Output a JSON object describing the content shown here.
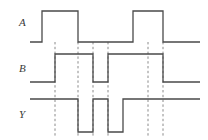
{
  "figure": {
    "type": "digital-timing-diagram",
    "width": 208,
    "height": 140,
    "background_color": "#ffffff",
    "waveform_color": "#4a4a4a",
    "marker_color": "#8a8a8a",
    "label_color": "#3a3a3a"
  },
  "labels": {
    "a": "A",
    "b": "B",
    "y": "Y"
  },
  "chart_data": {
    "type": "line",
    "title": "",
    "xlabel": "",
    "ylabel": "",
    "xlim": [
      30,
      200
    ],
    "grid": false,
    "legend": "none",
    "annotations": [],
    "marker_lines_x": [
      55,
      78,
      93,
      108,
      148,
      163
    ],
    "series": [
      {
        "name": "A",
        "label": "A",
        "low_y": 42,
        "high_y": 11,
        "start_x": 30,
        "end_x": 200,
        "initial_level": 0,
        "transitions": [
          {
            "x": 42,
            "level": 1
          },
          {
            "x": 78,
            "level": 0
          },
          {
            "x": 133,
            "level": 1
          },
          {
            "x": 163,
            "level": 0
          }
        ],
        "points": [
          [
            30,
            0
          ],
          [
            42,
            0
          ],
          [
            42,
            1
          ],
          [
            78,
            1
          ],
          [
            78,
            0
          ],
          [
            133,
            0
          ],
          [
            133,
            1
          ],
          [
            163,
            1
          ],
          [
            163,
            0
          ],
          [
            200,
            0
          ]
        ]
      },
      {
        "name": "B",
        "label": "B",
        "low_y": 82,
        "high_y": 54,
        "start_x": 30,
        "end_x": 200,
        "initial_level": 0,
        "transitions": [
          {
            "x": 55,
            "level": 1
          },
          {
            "x": 93,
            "level": 0
          },
          {
            "x": 108,
            "level": 1
          },
          {
            "x": 163,
            "level": 0
          }
        ],
        "points": [
          [
            30,
            0
          ],
          [
            55,
            0
          ],
          [
            55,
            1
          ],
          [
            93,
            1
          ],
          [
            93,
            0
          ],
          [
            108,
            0
          ],
          [
            108,
            1
          ],
          [
            163,
            1
          ],
          [
            163,
            0
          ],
          [
            200,
            0
          ]
        ]
      },
      {
        "name": "Y",
        "label": "Y",
        "low_y": 132,
        "high_y": 99,
        "start_x": 30,
        "end_x": 200,
        "initial_level": 1,
        "transitions": [
          {
            "x": 78,
            "level": 0
          },
          {
            "x": 93,
            "level": 1
          },
          {
            "x": 108,
            "level": 0
          },
          {
            "x": 123,
            "level": 1
          }
        ],
        "points": [
          [
            30,
            1
          ],
          [
            78,
            1
          ],
          [
            78,
            0
          ],
          [
            93,
            0
          ],
          [
            93,
            1
          ],
          [
            108,
            1
          ],
          [
            108,
            0
          ],
          [
            123,
            0
          ],
          [
            123,
            1
          ],
          [
            200,
            1
          ]
        ]
      }
    ]
  }
}
